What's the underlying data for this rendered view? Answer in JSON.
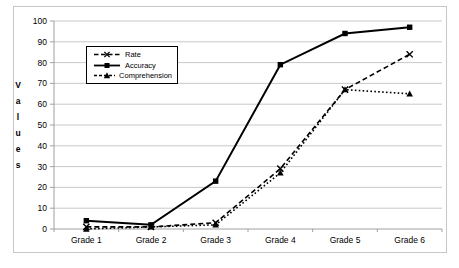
{
  "chart_data": {
    "type": "line",
    "title": "",
    "categories": [
      "Grade 1",
      "Grade 2",
      "Grade 3",
      "Grade 4",
      "Grade 5",
      "Grade 6"
    ],
    "series": [
      {
        "name": "Rate",
        "values": [
          1,
          1,
          3,
          29,
          67,
          84
        ],
        "line": "dashed",
        "marker": "x"
      },
      {
        "name": "Accuracy",
        "values": [
          4,
          2,
          23,
          79,
          94,
          97
        ],
        "line": "solid",
        "marker": "square"
      },
      {
        "name": "Comprehension",
        "values": [
          0,
          1,
          2,
          27,
          67,
          65
        ],
        "line": "dotted",
        "marker": "triangle"
      }
    ],
    "xlabel": "",
    "ylabel": "Values",
    "ylim": [
      0,
      100
    ],
    "ytick_step": 10,
    "yticks": [
      "0",
      "10",
      "20",
      "30",
      "40",
      "50",
      "60",
      "70",
      "80",
      "90",
      "100"
    ],
    "grid": true,
    "legend_position": "upper-left-inside",
    "colors": {
      "series": "#000000",
      "gridline": "#c9c9c9",
      "axis": "#a0a0a0",
      "frame_border": "#c6c6c6",
      "background": "#ffffff",
      "text": "#000000"
    }
  }
}
